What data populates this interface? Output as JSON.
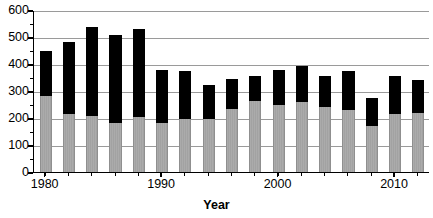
{
  "chart_data": {
    "type": "bar",
    "title": "",
    "subtitle": "",
    "xlabel": "Year",
    "ylabel": "",
    "stacked": true,
    "grid": true,
    "legend": "none",
    "xlim": [
      1979,
      2013
    ],
    "ylim": [
      0,
      600
    ],
    "ytick_values": [
      0,
      100,
      200,
      300,
      400,
      500,
      600
    ],
    "ytick_labels": [
      "0",
      "100",
      "200",
      "300",
      "400",
      "500",
      "600"
    ],
    "xtick_values": [
      1980,
      1990,
      2000,
      2010
    ],
    "xtick_labels": [
      "1980",
      "1990",
      "2000",
      "2010"
    ],
    "categories": [
      1980,
      1982,
      1984,
      1986,
      1988,
      1990,
      1992,
      1994,
      1996,
      1998,
      2000,
      2002,
      2004,
      2006,
      2008,
      2010,
      2012
    ],
    "series": [
      {
        "name": "lower-segment",
        "color": "#a9a9a9",
        "values": [
          281,
          215,
          209,
          183,
          204,
          181,
          196,
          196,
          232,
          263,
          250,
          259,
          242,
          228,
          172,
          215,
          217
        ]
      },
      {
        "name": "upper-segment",
        "color": "#000000",
        "values": [
          168,
          266,
          327,
          323,
          327,
          196,
          179,
          126,
          113,
          91,
          128,
          135,
          114,
          145,
          101,
          142,
          125
        ]
      }
    ],
    "totals": [
      449,
      481,
      536,
      506,
      531,
      377,
      375,
      322,
      345,
      354,
      378,
      394,
      356,
      373,
      273,
      357,
      342
    ]
  }
}
